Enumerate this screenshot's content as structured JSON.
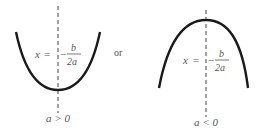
{
  "figures": [
    {
      "id": "upward",
      "axis_label": {
        "var": "x",
        "eq": "=",
        "minus": "−",
        "num": "b",
        "den": "2a"
      },
      "condition": "a > 0"
    },
    {
      "id": "downward",
      "axis_label": {
        "var": "x",
        "eq": "=",
        "minus": "−",
        "num": "b",
        "den": "2a"
      },
      "condition": "a < 0"
    }
  ],
  "connector": "or",
  "colors": {
    "curve": "#1a1a1a",
    "axis": "#444444",
    "text": "#555555"
  }
}
